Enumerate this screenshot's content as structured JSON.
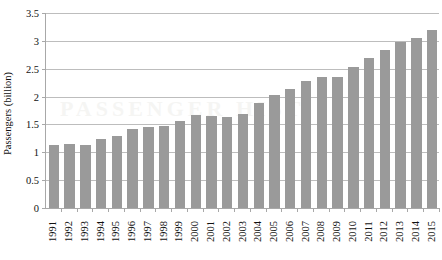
{
  "chart_data": {
    "type": "bar",
    "title": "",
    "xlabel": "",
    "ylabel": "Passengers (billion)",
    "ylim": [
      0,
      3.5
    ],
    "yticks": [
      "0",
      "0.5",
      "1",
      "1.5",
      "2",
      "2.5",
      "3",
      "3.5"
    ],
    "ytick_values": [
      0,
      0.5,
      1,
      1.5,
      2,
      2.5,
      3,
      3.5
    ],
    "grid": true,
    "legend": "none",
    "bar_color": "#9a9a9a",
    "categories": [
      "1991",
      "1992",
      "1993",
      "1994",
      "1995",
      "1996",
      "1997",
      "1998",
      "1999",
      "2000",
      "2001",
      "2002",
      "2003",
      "2004",
      "2005",
      "2006",
      "2007",
      "2008",
      "2009",
      "2010",
      "2011",
      "2012",
      "2013",
      "2014",
      "2015"
    ],
    "values": [
      1.13,
      1.15,
      1.14,
      1.23,
      1.3,
      1.41,
      1.46,
      1.48,
      1.56,
      1.67,
      1.65,
      1.64,
      1.69,
      1.89,
      2.02,
      2.13,
      2.28,
      2.35,
      2.35,
      2.53,
      2.7,
      2.84,
      2.98,
      3.05,
      3.2
    ]
  },
  "watermark": {
    "text": "PASSENGER HISTORY"
  }
}
